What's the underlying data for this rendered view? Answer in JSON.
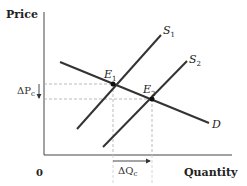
{
  "diagram": {
    "type": "supply-demand",
    "axes": {
      "y_label": "Price",
      "x_label": "Quantity",
      "origin_label": "0"
    },
    "curves": {
      "demand": {
        "label": "D"
      },
      "supply_1": {
        "label": "S",
        "subscript": "1"
      },
      "supply_2": {
        "label": "S",
        "subscript": "2"
      }
    },
    "equilibria": [
      {
        "label": "E",
        "subscript": "1"
      },
      {
        "label": "E",
        "subscript": "2"
      }
    ],
    "changes": {
      "price_change": {
        "prefix": "ΔP",
        "subscript": "c",
        "direction": "down"
      },
      "quantity_change": {
        "prefix": "ΔQ",
        "subscript": "c",
        "direction": "right"
      }
    },
    "colors": {
      "line": "#333333",
      "dashed": "#aaaaaa",
      "text": "#222222"
    }
  }
}
